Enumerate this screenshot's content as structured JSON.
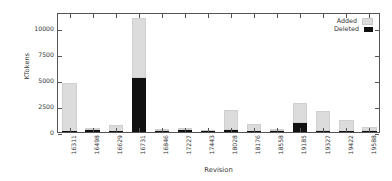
{
  "chart_data": {
    "type": "bar",
    "subtype": "stacked-bar",
    "title": "",
    "xlabel": "Revision",
    "ylabel": "KTokens",
    "categories": [
      "16311",
      "16498",
      "16629",
      "16731",
      "16846",
      "17227",
      "17443",
      "18028",
      "18176",
      "18558",
      "19185",
      "19327",
      "19422",
      "19588"
    ],
    "series": [
      {
        "name": "Deleted",
        "color": "#111111",
        "values": [
          30,
          150,
          30,
          5200,
          70,
          180,
          20,
          230,
          30,
          60,
          820,
          60,
          30,
          120
        ]
      },
      {
        "name": "Added",
        "color": "#dcdcdc",
        "values": [
          4670,
          50,
          620,
          5700,
          50,
          30,
          20,
          1870,
          740,
          50,
          1980,
          1940,
          1150,
          330
        ]
      }
    ],
    "totals": [
      4700,
      200,
      650,
      10900,
      120,
      210,
      40,
      2100,
      770,
      110,
      2800,
      2000,
      1180,
      450
    ],
    "ylim": [
      0,
      11500
    ],
    "yticks": [
      0,
      2500,
      5000,
      7500,
      10000
    ],
    "ytick_labels": [
      "0",
      "2500",
      "5000",
      "7500",
      "10000"
    ],
    "grid": false,
    "legend_position": "top-right",
    "xtick_rotation": -90
  },
  "legend": {
    "entries": [
      {
        "label": "Added",
        "swatch": "added"
      },
      {
        "label": "Deleted",
        "swatch": "deleted"
      }
    ]
  },
  "axes": {
    "ylabel": "KTokens",
    "xlabel": "Revision"
  }
}
